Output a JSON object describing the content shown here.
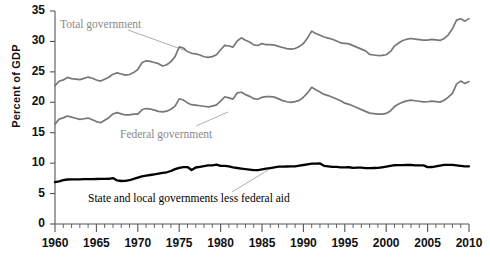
{
  "chart_data": {
    "type": "line",
    "title": "",
    "subtitle": "",
    "xlabel": "",
    "ylabel": "Percent of GDP",
    "xlim": [
      1960,
      2010
    ],
    "ylim": [
      0,
      35
    ],
    "ytick_step": 5,
    "xtick_step": 5,
    "minor_xtick_step": 1,
    "grid": false,
    "legend_position": "inline-annotations",
    "yticks": [
      "0",
      "5",
      "10",
      "15",
      "20",
      "25",
      "30",
      "35"
    ],
    "xticks": [
      "1960",
      "1965",
      "1970",
      "1975",
      "1980",
      "1985",
      "1990",
      "1995",
      "2000",
      "2005",
      "2010"
    ],
    "colors": {
      "total_government": "#777777",
      "federal_government": "#777777",
      "state_and_local": "#000000",
      "axis": "#555555",
      "leader_line": "#999999"
    },
    "series": [
      {
        "name": "Total government",
        "color": "#777777",
        "label_text": "Total government",
        "x": [
          1960.0,
          1960.5,
          1961.0,
          1961.5,
          1962.0,
          1962.5,
          1963.0,
          1963.5,
          1964.0,
          1964.5,
          1965.0,
          1965.5,
          1966.0,
          1966.5,
          1967.0,
          1967.5,
          1968.0,
          1968.5,
          1969.0,
          1969.5,
          1970.0,
          1970.5,
          1971.0,
          1971.5,
          1972.0,
          1972.5,
          1973.0,
          1973.5,
          1974.0,
          1974.5,
          1975.0,
          1975.5,
          1976.0,
          1976.5,
          1977.0,
          1977.5,
          1978.0,
          1978.5,
          1979.0,
          1979.5,
          1980.0,
          1980.5,
          1981.0,
          1981.5,
          1982.0,
          1982.5,
          1983.0,
          1983.5,
          1984.0,
          1984.5,
          1985.0,
          1985.5,
          1986.0,
          1986.5,
          1987.0,
          1987.5,
          1988.0,
          1988.5,
          1989.0,
          1989.5,
          1990.0,
          1990.5,
          1991.0,
          1991.5,
          1992.0,
          1992.5,
          1993.0,
          1993.5,
          1994.0,
          1994.5,
          1995.0,
          1995.5,
          1996.0,
          1996.5,
          1997.0,
          1997.5,
          1998.0,
          1998.5,
          1999.0,
          1999.5,
          2000.0,
          2000.5,
          2001.0,
          2001.5,
          2002.0,
          2002.5,
          2003.0,
          2003.5,
          2004.0,
          2004.5,
          2005.0,
          2005.5,
          2006.0,
          2006.5,
          2007.0,
          2007.5,
          2008.0,
          2008.5,
          2009.0,
          2009.5,
          2010.0
        ],
        "y": [
          22.9,
          23.6,
          23.8,
          24.2,
          24.0,
          23.9,
          23.8,
          24.0,
          24.2,
          24.0,
          23.7,
          23.5,
          23.8,
          24.1,
          24.6,
          24.8,
          24.6,
          24.4,
          24.5,
          24.8,
          25.3,
          26.4,
          26.7,
          26.6,
          26.4,
          26.2,
          26.1,
          26.3,
          26.8,
          27.6,
          29.2,
          29.0,
          28.4,
          28.1,
          28.0,
          27.8,
          27.5,
          27.4,
          27.5,
          27.8,
          28.6,
          29.3,
          29.2,
          29.0,
          30.0,
          30.5,
          30.1,
          29.8,
          29.3,
          29.2,
          29.5,
          29.6,
          29.6,
          29.5,
          29.3,
          29.1,
          28.9,
          28.8,
          28.9,
          29.2,
          29.7,
          30.6,
          31.7,
          31.3,
          31.0,
          30.7,
          30.5,
          30.3,
          30.0,
          29.7,
          29.6,
          29.5,
          29.2,
          28.9,
          28.6,
          28.3,
          28.0,
          27.9,
          27.8,
          27.8,
          27.9,
          28.4,
          29.3,
          29.8,
          30.2,
          30.4,
          30.5,
          30.4,
          30.3,
          30.2,
          30.2,
          30.3,
          30.2,
          30.1,
          30.4,
          31.0,
          32.0,
          33.4,
          33.6,
          33.2,
          33.6
        ]
      },
      {
        "name": "Federal government",
        "color": "#777777",
        "label_text": "Federal government",
        "x": [
          1960.0,
          1960.5,
          1961.0,
          1961.5,
          1962.0,
          1962.5,
          1963.0,
          1963.5,
          1964.0,
          1964.5,
          1965.0,
          1965.5,
          1966.0,
          1966.5,
          1967.0,
          1967.5,
          1968.0,
          1968.5,
          1969.0,
          1969.5,
          1970.0,
          1970.5,
          1971.0,
          1971.5,
          1972.0,
          1972.5,
          1973.0,
          1973.5,
          1974.0,
          1974.5,
          1975.0,
          1975.5,
          1976.0,
          1976.5,
          1977.0,
          1977.5,
          1978.0,
          1978.5,
          1979.0,
          1979.5,
          1980.0,
          1980.5,
          1981.0,
          1981.5,
          1982.0,
          1982.5,
          1983.0,
          1983.5,
          1984.0,
          1984.5,
          1985.0,
          1985.5,
          1986.0,
          1986.5,
          1987.0,
          1987.5,
          1988.0,
          1988.5,
          1989.0,
          1989.5,
          1990.0,
          1990.5,
          1991.0,
          1991.5,
          1992.0,
          1992.5,
          1993.0,
          1993.5,
          1994.0,
          1994.5,
          1995.0,
          1995.5,
          1996.0,
          1996.5,
          1997.0,
          1997.5,
          1998.0,
          1998.5,
          1999.0,
          1999.5,
          2000.0,
          2000.5,
          2001.0,
          2001.5,
          2002.0,
          2002.5,
          2003.0,
          2003.5,
          2004.0,
          2004.5,
          2005.0,
          2005.5,
          2006.0,
          2006.5,
          2007.0,
          2007.5,
          2008.0,
          2008.5,
          2009.0,
          2009.5,
          2010.0
        ],
        "y": [
          16.5,
          17.3,
          17.5,
          17.8,
          17.6,
          17.4,
          17.2,
          17.3,
          17.4,
          17.1,
          16.8,
          16.6,
          17.0,
          17.4,
          18.0,
          18.2,
          18.0,
          17.8,
          17.8,
          17.9,
          18.2,
          18.9,
          19.1,
          19.0,
          18.8,
          18.6,
          18.5,
          18.6,
          18.9,
          19.4,
          20.6,
          20.4,
          19.9,
          19.6,
          19.5,
          19.4,
          19.3,
          19.2,
          19.3,
          19.5,
          20.1,
          20.8,
          20.6,
          20.4,
          21.4,
          21.8,
          21.4,
          21.1,
          20.7,
          20.6,
          20.9,
          21.0,
          21.0,
          20.9,
          20.6,
          20.3,
          20.1,
          20.0,
          20.1,
          20.3,
          20.8,
          21.5,
          22.4,
          22.0,
          21.6,
          21.2,
          21.0,
          20.7,
          20.4,
          20.1,
          20.0,
          19.8,
          19.5,
          19.2,
          18.9,
          18.6,
          18.3,
          18.2,
          18.1,
          18.1,
          18.2,
          18.6,
          19.3,
          19.7,
          20.0,
          20.2,
          20.3,
          20.2,
          20.1,
          20.0,
          20.0,
          20.1,
          20.0,
          19.9,
          20.2,
          20.7,
          21.6,
          23.1,
          23.6,
          23.2,
          23.5
        ]
      },
      {
        "name": "State and local governments less federal aid",
        "color": "#000000",
        "label_text": "State and local governments less federal aid",
        "x": [
          1960.0,
          1960.5,
          1961.0,
          1961.5,
          1962.0,
          1962.5,
          1963.0,
          1963.5,
          1964.0,
          1964.5,
          1965.0,
          1965.5,
          1966.0,
          1966.5,
          1967.0,
          1967.5,
          1968.0,
          1968.5,
          1969.0,
          1969.5,
          1970.0,
          1970.5,
          1971.0,
          1971.5,
          1972.0,
          1972.5,
          1973.0,
          1973.5,
          1974.0,
          1974.5,
          1975.0,
          1975.5,
          1976.0,
          1976.5,
          1977.0,
          1977.5,
          1978.0,
          1978.5,
          1979.0,
          1979.5,
          1980.0,
          1980.5,
          1981.0,
          1981.5,
          1982.0,
          1982.5,
          1983.0,
          1983.5,
          1984.0,
          1984.5,
          1985.0,
          1985.5,
          1986.0,
          1986.5,
          1987.0,
          1987.5,
          1988.0,
          1988.5,
          1989.0,
          1989.5,
          1990.0,
          1990.5,
          1991.0,
          1991.5,
          1992.0,
          1992.5,
          1993.0,
          1993.5,
          1994.0,
          1994.5,
          1995.0,
          1995.5,
          1996.0,
          1996.5,
          1997.0,
          1997.5,
          1998.0,
          1998.5,
          1999.0,
          1999.5,
          2000.0,
          2000.5,
          2001.0,
          2001.5,
          2002.0,
          2002.5,
          2003.0,
          2003.5,
          2004.0,
          2004.5,
          2005.0,
          2005.5,
          2006.0,
          2006.5,
          2007.0,
          2007.5,
          2008.0,
          2008.5,
          2009.0,
          2009.5,
          2010.0
        ],
        "y": [
          6.9,
          7.0,
          7.2,
          7.3,
          7.3,
          7.3,
          7.3,
          7.3,
          7.3,
          7.3,
          7.3,
          7.3,
          7.3,
          7.3,
          7.4,
          7.3,
          7.2,
          7.2,
          7.3,
          7.5,
          7.7,
          7.9,
          8.0,
          8.1,
          8.2,
          8.3,
          8.4,
          8.5,
          8.7,
          9.0,
          9.2,
          9.3,
          9.3,
          8.8,
          9.2,
          9.3,
          9.4,
          9.5,
          9.5,
          9.6,
          9.7,
          9.7,
          9.6,
          9.4,
          9.3,
          9.2,
          9.1,
          9.0,
          8.9,
          8.9,
          9.0,
          9.1,
          9.2,
          9.3,
          9.4,
          9.4,
          9.4,
          9.4,
          9.4,
          9.5,
          9.6,
          9.7,
          9.8,
          9.8,
          9.8,
          9.7,
          9.6,
          9.5,
          9.5,
          9.4,
          9.4,
          9.4,
          9.3,
          9.3,
          9.3,
          9.2,
          9.2,
          9.2,
          9.2,
          9.3,
          9.4,
          9.5,
          9.6,
          9.6,
          9.6,
          9.6,
          9.6,
          9.5,
          9.5,
          9.5,
          9.5,
          9.5,
          9.6,
          9.7,
          9.8,
          9.8,
          9.8,
          9.7,
          9.6,
          9.5,
          9.5
        ]
      }
    ]
  },
  "annotations": {
    "total_government": {
      "text": "Total government",
      "color": "#8a8a8a",
      "x": 60,
      "y": 18,
      "leader": {
        "x1": 128,
        "y1": 30,
        "x2": 192,
        "y2": 53
      }
    },
    "federal_government": {
      "text": "Federal government",
      "color": "#8a8a8a",
      "x": 120,
      "y": 128,
      "leader": {
        "x1": 196,
        "y1": 126,
        "x2": 228,
        "y2": 112
      }
    },
    "state_and_local": {
      "text": "State and local governments less federal aid",
      "color": "#000000",
      "x": 88,
      "y": 192,
      "leader": {
        "x1": 232,
        "y1": 192,
        "x2": 268,
        "y2": 170
      }
    }
  },
  "axis": {
    "y_label": "Percent of GDP",
    "y_tick_labels": [
      "35",
      "30",
      "25",
      "20",
      "15",
      "10",
      "5",
      "0"
    ],
    "x_tick_labels": [
      "1960",
      "1965",
      "1970",
      "1975",
      "1980",
      "1985",
      "1990",
      "1995",
      "2000",
      "2005",
      "2010"
    ]
  }
}
